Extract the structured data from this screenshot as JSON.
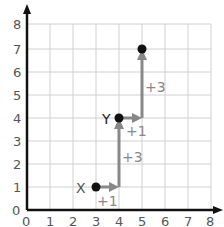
{
  "grid": {
    "x_ticks": [
      "0",
      "1",
      "2",
      "3",
      "4",
      "5",
      "6",
      "7",
      "8"
    ],
    "y_ticks": [
      "1",
      "2",
      "3",
      "4",
      "5",
      "6",
      "7",
      "8"
    ],
    "origin_label": "0"
  },
  "points": [
    {
      "label": "X",
      "x": 3,
      "y": 1
    },
    {
      "label": "Y",
      "x": 4,
      "y": 4
    },
    {
      "label": "",
      "x": 5,
      "y": 7
    }
  ],
  "steps": [
    {
      "label": "+1",
      "direction": "right",
      "from": [
        3,
        1
      ],
      "to": [
        4,
        1
      ]
    },
    {
      "label": "+3",
      "direction": "up",
      "from": [
        4,
        1
      ],
      "to": [
        4,
        4
      ]
    },
    {
      "label": "+1",
      "direction": "right",
      "from": [
        4,
        4
      ],
      "to": [
        5,
        4
      ]
    },
    {
      "label": "+3",
      "direction": "up",
      "from": [
        5,
        4
      ],
      "to": [
        5,
        7
      ]
    }
  ],
  "colors": {
    "arrow": "#888888",
    "point": "#111111",
    "grid": "#cccccc",
    "axis": "#111111"
  }
}
